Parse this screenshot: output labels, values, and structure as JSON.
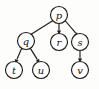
{
  "diagram": {
    "type": "directed-tree",
    "title": "",
    "background_color": "#fdfdfc",
    "node_fill": "#ffffff",
    "stroke_color": "#1b1b1b",
    "nodes": [
      {
        "id": "p",
        "label": "p",
        "cx": 59,
        "cy": 15,
        "r": 8.5
      },
      {
        "id": "q",
        "label": "q",
        "cx": 26,
        "cy": 41,
        "r": 8.5
      },
      {
        "id": "r",
        "label": "r",
        "cx": 59,
        "cy": 42,
        "r": 8.5
      },
      {
        "id": "s",
        "label": "s",
        "cx": 80,
        "cy": 42,
        "r": 8.5
      },
      {
        "id": "t",
        "label": "t",
        "cx": 14,
        "cy": 70,
        "r": 8.5
      },
      {
        "id": "u",
        "label": "u",
        "cx": 41,
        "cy": 70,
        "r": 8.5
      },
      {
        "id": "v",
        "label": "v",
        "cx": 80,
        "cy": 70,
        "r": 8.5
      }
    ],
    "edges": [
      {
        "from": "p",
        "to": "q",
        "arrow": "solid-triangle"
      },
      {
        "from": "p",
        "to": "r",
        "arrow": "solid-triangle"
      },
      {
        "from": "p",
        "to": "s",
        "arrow": "solid-triangle"
      },
      {
        "from": "q",
        "to": "t",
        "arrow": "solid-triangle"
      },
      {
        "from": "q",
        "to": "u",
        "arrow": "solid-triangle"
      },
      {
        "from": "s",
        "to": "v",
        "arrow": "solid-triangle"
      }
    ]
  }
}
